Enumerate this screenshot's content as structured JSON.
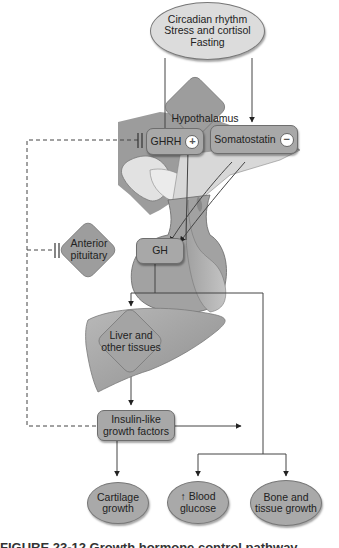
{
  "diagram": {
    "stimuli": {
      "lines": [
        "Circadian rhythm",
        "Stress and cortisol",
        "Fasting"
      ]
    },
    "hypothalamus": {
      "label": "Hypothalamus"
    },
    "ghrh": {
      "label": "GHRH",
      "effect": "+",
      "effect_icon": "plus-circle-icon"
    },
    "somatostatin": {
      "label": "Somatostatin",
      "effect": "−",
      "effect_icon": "minus-circle-icon"
    },
    "anterior_pituitary": {
      "line1": "Anterior",
      "line2": "pituitary"
    },
    "gh": {
      "label": "GH"
    },
    "liver": {
      "line1": "Liver and",
      "line2": "other tissues"
    },
    "igf": {
      "line1": "Insulin-like",
      "line2": "growth factors"
    },
    "outcomes": [
      {
        "line1": "Cartilage",
        "line2": "growth"
      },
      {
        "line1": "↑ Blood",
        "line2": "glucose"
      },
      {
        "line1": "Bone and",
        "line2": "tissue growth"
      }
    ],
    "caption": "FIGURE 23-12  Growth hormone control pathway"
  },
  "colors": {
    "node_fill": "#a8a8a8",
    "diamond_fill": "#9a9a9a",
    "line": "#444444",
    "background": "#ffffff"
  }
}
